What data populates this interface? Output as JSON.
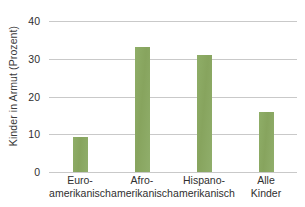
{
  "chart_data": {
    "type": "bar",
    "title": "",
    "xlabel": "",
    "ylabel": "Kinder in Armut (Prozent)",
    "categories": [
      "Euro-\namerikanisch",
      "Afro-\namerikanisch",
      "Hispano-\namerikanisch",
      "Alle\nKinder"
    ],
    "category_lines": [
      [
        "Euro-",
        "amerikanisch"
      ],
      [
        "Afro-",
        "amerikanisch"
      ],
      [
        "Hispano-",
        "amerikanisch"
      ],
      [
        "Alle",
        "Kinder"
      ]
    ],
    "values": [
      9.3,
      33,
      31,
      16
    ],
    "ylim": [
      0,
      40
    ],
    "yticks": [
      0,
      10,
      20,
      30,
      40
    ],
    "ytick_labels": [
      "0",
      "10",
      "20",
      "30",
      "40"
    ],
    "grid": true,
    "legend": false,
    "bar_color": "#8aa862",
    "gridline_color": "#c9c9c9",
    "text_color": "#2f2f2f",
    "background": "#ffffff"
  }
}
